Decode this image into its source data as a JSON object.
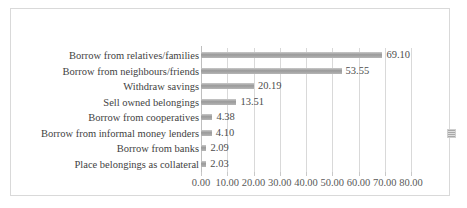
{
  "chart_data": {
    "type": "bar",
    "orientation": "horizontal",
    "title": "",
    "subtitle": "",
    "xlabel": "",
    "ylabel": "",
    "xlim": [
      0,
      80
    ],
    "xtick_step": 10,
    "grid": true,
    "legend_position": "right",
    "legend_entries": [
      ""
    ],
    "xticklabels": [
      "0.00",
      "10.00",
      "20.00",
      "30.00",
      "40.00",
      "50.00",
      "60.00",
      "70.00",
      "80.00"
    ],
    "xtickvalues": [
      0,
      10,
      20,
      30,
      40,
      50,
      60,
      70,
      80
    ],
    "categories": [
      "Borrow from relatives/families",
      "Borrow from neighbours/friends",
      "Withdraw savings",
      "Sell owned belongings",
      "Borrow from cooperatives",
      "Borrow from informal money lenders",
      "Borrow from banks",
      "Place belongings as collateral"
    ],
    "values": [
      69.1,
      53.55,
      20.19,
      13.51,
      4.38,
      4.1,
      2.09,
      2.03
    ],
    "datalabels": [
      "69.10",
      "53.55",
      "20.19",
      "13.51",
      "4.38",
      "4.10",
      "2.09",
      "2.03"
    ],
    "colors": {
      "bar": "#9a9a9a",
      "gridline": "#d9d9d9",
      "axis": "#bfbfbf",
      "label_text": "#3f3f3f",
      "value_text": "#4d4d4d",
      "tick_text": "#595959",
      "frame_border": "#d9d9d9",
      "background": "#ffffff"
    }
  }
}
